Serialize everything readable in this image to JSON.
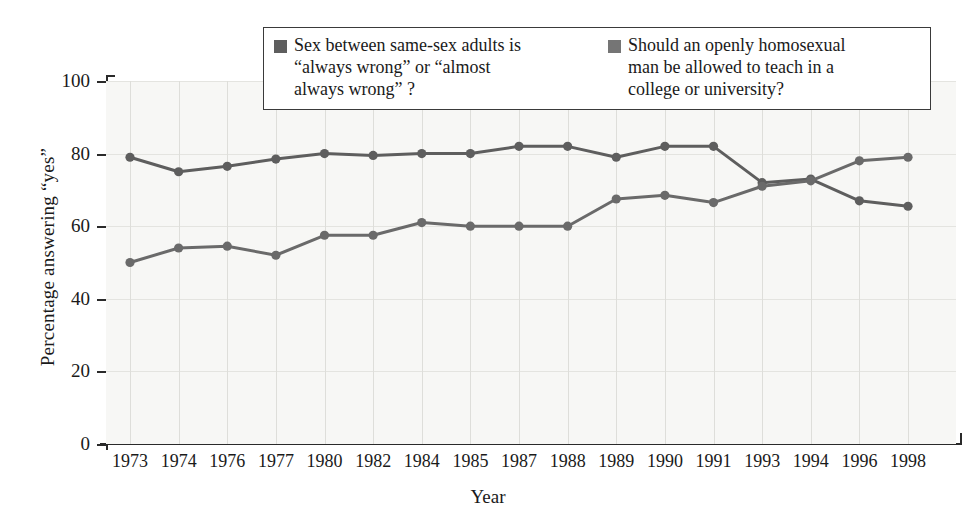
{
  "chart_data": {
    "type": "line",
    "title": "",
    "xlabel": "Year",
    "ylabel": "Percentage answering “yes”",
    "categories": [
      "1973",
      "1974",
      "1976",
      "1977",
      "1980",
      "1982",
      "1984",
      "1985",
      "1987",
      "1988",
      "1989",
      "1990",
      "1991",
      "1993",
      "1994",
      "1996",
      "1998"
    ],
    "ylim": [
      0,
      100
    ],
    "yticks": [
      0,
      20,
      40,
      60,
      80,
      100
    ],
    "grid": true,
    "legend_position": "top-center",
    "series": [
      {
        "name": "Sex between same-sex adults is “always wrong”  or “almost always wrong” ?",
        "color": "#5e5e5e",
        "values": [
          79,
          75,
          76.5,
          78.5,
          80,
          79.5,
          80,
          80,
          82,
          82,
          79,
          82,
          82,
          72,
          73,
          67,
          65.5
        ]
      },
      {
        "name": "Should an openly homosexual man be allowed to teach in a college or university?",
        "color": "#6a6a6a",
        "values": [
          50,
          54,
          54.5,
          52,
          57.5,
          57.5,
          61,
          60,
          60,
          60,
          67.5,
          68.5,
          66.5,
          71,
          72.5,
          78,
          79
        ]
      }
    ]
  },
  "legend": {
    "entries": [
      {
        "swatch_color": "#5e5e5e",
        "line1": "Sex between same-sex adults is",
        "line2": "“always wrong”  or “almost",
        "line3": "always wrong” ?"
      },
      {
        "swatch_color": "#757575",
        "line1": "Should an openly homosexual",
        "line2": "man be allowed to teach in a",
        "line3": "college or university?"
      }
    ]
  },
  "axes": {
    "y_title": "Percentage answering “yes”",
    "x_title": "Year",
    "y_tick_labels": [
      "100",
      "80",
      "60",
      "40",
      "20",
      "0"
    ],
    "x_tick_labels": [
      "1973",
      "1974",
      "1976",
      "1977",
      "1980",
      "1982",
      "1984",
      "1985",
      "1987",
      "1988",
      "1989",
      "1990",
      "1991",
      "1993",
      "1994",
      "1996",
      "1998"
    ]
  },
  "colors": {
    "plot_background": "#f7f7f5",
    "axis": "#2a2a2a",
    "grid": "#dededa",
    "series_1": "#5e5e5e",
    "series_2": "#6a6a6a"
  }
}
